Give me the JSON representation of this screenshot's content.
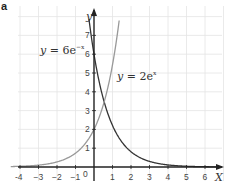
{
  "panel_label": "a",
  "chart_data": {
    "type": "line",
    "title": "",
    "xlabel": "x",
    "ylabel": "y",
    "xlim": [
      -4.5,
      6.8
    ],
    "ylim": [
      -0.4,
      8
    ],
    "grid": true,
    "x_ticks": [
      -4,
      -3,
      -2,
      -1,
      0,
      1,
      2,
      3,
      4,
      5,
      6
    ],
    "y_ticks": [
      1,
      2,
      3,
      4,
      5,
      6,
      7
    ],
    "series": [
      {
        "name": "y = 6e^-x",
        "formula": "6*exp(-x)",
        "color": "#333333",
        "points": [
          [
            -0.26,
            7.8
          ],
          [
            0,
            6
          ],
          [
            0.5,
            3.64
          ],
          [
            1,
            2.21
          ],
          [
            1.5,
            1.34
          ],
          [
            2,
            0.81
          ],
          [
            3,
            0.3
          ],
          [
            4,
            0.11
          ],
          [
            5,
            0.04
          ],
          [
            6,
            0.015
          ],
          [
            6.5,
            0.009
          ]
        ]
      },
      {
        "name": "y = 2e^x",
        "formula": "2*exp(x)",
        "color": "#999999",
        "points": [
          [
            -4.5,
            0.022
          ],
          [
            -4,
            0.037
          ],
          [
            -3,
            0.1
          ],
          [
            -2,
            0.27
          ],
          [
            -1,
            0.74
          ],
          [
            0,
            2
          ],
          [
            0.5,
            3.3
          ],
          [
            1,
            5.44
          ],
          [
            1.35,
            7.7
          ]
        ]
      }
    ],
    "annotations": [
      {
        "text": "y = 6e^-x",
        "near": [
          -2.5,
          6.5
        ]
      },
      {
        "text": "y = 2e^x",
        "near": [
          1.5,
          4
        ]
      }
    ],
    "origin_label": "0"
  },
  "labels": {
    "eq1_y": "y",
    "eq1_rest": " = 6e",
    "eq1_exp": "−x",
    "eq2_y": "y",
    "eq2_rest": " = 2e",
    "eq2_exp": "x",
    "axis_x": "X",
    "axis_y": "y",
    "origin": "0",
    "xt": [
      "-4",
      "−3",
      "−2",
      "−1",
      "1",
      "2",
      "3",
      "4",
      "5",
      "6"
    ],
    "yt": [
      "1",
      "2",
      "3",
      "4",
      "5",
      "6",
      "7"
    ]
  }
}
